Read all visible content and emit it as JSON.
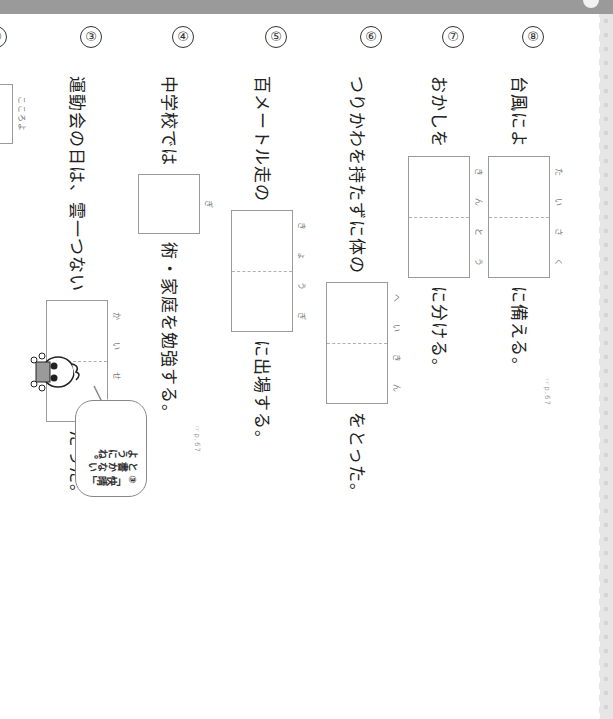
{
  "header": {
    "bar_color": "#9a9a9a"
  },
  "questions": [
    {
      "num": "⑧",
      "before": "台風によ",
      "after": "に備える。",
      "box_chars": 2,
      "ruby": [
        "た",
        "い",
        "さ",
        "く"
      ],
      "after_ruby": "そな",
      "ref": "☞p.67"
    },
    {
      "num": "⑦",
      "before": "おかしを",
      "after": "に分ける。",
      "box_chars": 2,
      "ruby": [
        "き",
        "ん",
        "と",
        "う"
      ]
    },
    {
      "num": "⑥",
      "before": "つりかわを持たずに体の",
      "after": "をとった。",
      "box_chars": 2,
      "ruby": [
        "へ",
        "い",
        "き",
        "ん"
      ]
    },
    {
      "num": "⑤",
      "before": "百メートル走の",
      "after": "に出場する。",
      "box_chars": 2,
      "ruby": [
        "き",
        "ょ",
        "う",
        "ぎ"
      ]
    },
    {
      "num": "④",
      "before": "中学校では",
      "after": "術・家庭を勉強する。",
      "box_chars": 1,
      "ruby": [
        "ぎ"
      ],
      "after_ruby": "じゅつ",
      "ref": "☞p.67"
    },
    {
      "num": "③",
      "before": "運動会の日は、雲一つない",
      "after": "だった。",
      "box_chars": 2,
      "ruby": [
        "か",
        "い",
        "せ",
        "い"
      ]
    },
    {
      "num": "②",
      "before": "",
      "after": "くだのみを引き受けてくれた。",
      "box_chars": 1,
      "ruby": [
        "こころよ"
      ]
    },
    {
      "num": "①",
      "before": "父は、時と場合に",
      "after": "じて手帳を使い分けている。",
      "box_chars": 1,
      "ruby": [
        "お",
        "う"
      ]
    }
  ],
  "mascot": {
    "bubble_text": [
      "③「快晴」",
      "と書かない",
      "ようにね。"
    ]
  }
}
